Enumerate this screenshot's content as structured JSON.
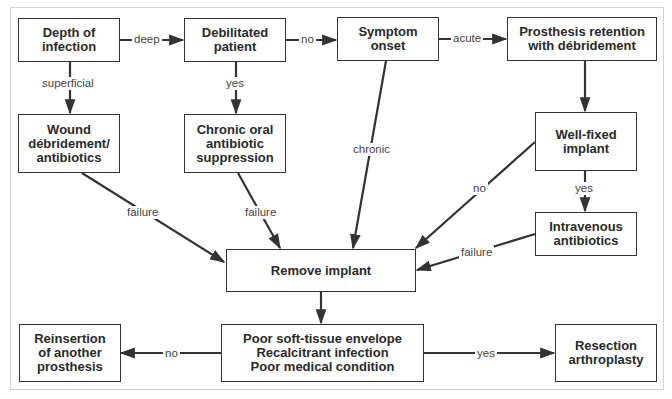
{
  "nodes": {
    "depth": "Depth of\ninfection",
    "debilitated": "Debilitated\npatient",
    "symptom": "Symptom\nonset",
    "retention": "Prosthesis retention\nwith débridement",
    "wound": "Wound\ndébridement/\nantibiotics",
    "chronic_oral": "Chronic oral\nantibiotic\nsuppression",
    "well_fixed": "Well-fixed\nimplant",
    "iv": "Intravenous\nantibiotics",
    "remove": "Remove implant",
    "conditions": "Poor soft-tissue envelope\nRecalcitrant infection\nPoor medical condition",
    "reinsertion": "Reinsertion\nof another\nprosthesis",
    "resection": "Resection\narthroplasty"
  },
  "edges": {
    "deep": "deep",
    "no_debilitated": "no",
    "acute": "acute",
    "superficial": "superficial",
    "yes_debilitated": "yes",
    "chronic": "chronic",
    "no_wellfixed": "no",
    "yes_wellfixed": "yes",
    "failure_wound": "failure",
    "failure_oral": "failure",
    "failure_iv": "failure",
    "no_conditions": "no",
    "yes_conditions": "yes"
  },
  "colors": {
    "line": "#333333",
    "frame": "#d4d4d4",
    "text": "#2a2a2a"
  }
}
